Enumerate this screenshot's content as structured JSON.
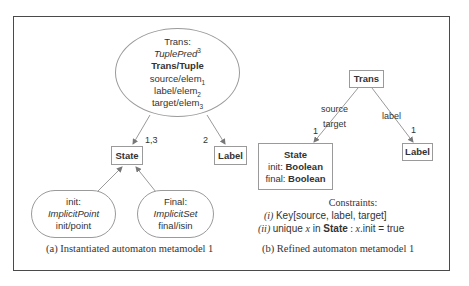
{
  "figure_a": {
    "trans_node": {
      "name": "Trans:",
      "pred": "TuplePred",
      "pred_sup": "3",
      "mapping": "Trans/Tuple",
      "rows": [
        {
          "text": "source/elem",
          "sub": "1"
        },
        {
          "text": "label/elem",
          "sub": "2"
        },
        {
          "text": "target/elem",
          "sub": "3"
        }
      ]
    },
    "state_box": "State",
    "label_box": "Label",
    "edge_state_label": "1,3",
    "edge_label_label": "2",
    "init_node": {
      "name": "init:",
      "pred": "ImplicitPoint",
      "mapping": "init/point"
    },
    "final_node": {
      "name": "Final:",
      "pred": "ImplicitSet",
      "mapping": "final/isin"
    },
    "caption": "(a) Instantiated automaton metamodel 1"
  },
  "figure_b": {
    "trans_box": "Trans",
    "state_box": {
      "title": "State",
      "attrs": [
        {
          "name": "init: ",
          "type": "Boolean"
        },
        {
          "name": "final: ",
          "type": "Boolean"
        }
      ]
    },
    "label_box": "Label",
    "edge_state_roles": [
      "source",
      "target"
    ],
    "edge_state_mult": "1",
    "edge_label_role": "label",
    "edge_label_mult": "1",
    "constraints": {
      "title": "Constraints:",
      "items": [
        {
          "num": "(i)",
          "text": "Key[source, label, target]"
        },
        {
          "num": "(ii)",
          "pre": "unique ",
          "var": "x",
          "mid": " in ",
          "bold": "State",
          "post_a": " : ",
          "var2": "x",
          "post_b": ".init = true"
        }
      ]
    },
    "caption": "(b) Refined automaton metamodel 1"
  }
}
